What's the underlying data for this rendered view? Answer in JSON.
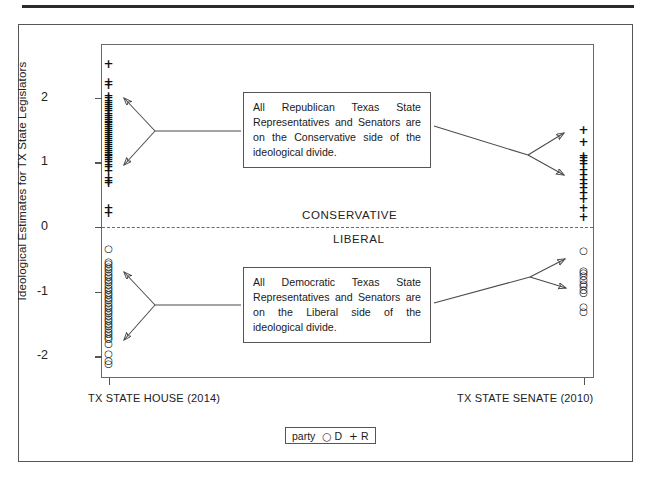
{
  "figure": {
    "y_axis_title": "Ideological Estimates for TX State Legislators",
    "divide": {
      "upper_label": "CONSERVATIVE",
      "lower_label": "LIBERAL"
    },
    "callouts": {
      "republican": "All Republican Texas State Representatives and Senators are on the Conservative side of the ideological divide.",
      "democrat": "All Democratic Texas State Representatives and Senators are on the Liberal side of the ideological divide."
    },
    "legend": {
      "title": "party",
      "d_symbol": "○",
      "d_label": "D",
      "r_symbol": "+",
      "r_label": "R"
    },
    "colors": {
      "frame": "#555555",
      "text": "#1a1a1a",
      "marker": "#111111",
      "zero_line": "#6b6b6b"
    }
  },
  "chart_data": {
    "type": "scatter",
    "title": "",
    "xlabel": "",
    "ylabel": "Ideological Estimates for TX State Legislators",
    "ylim": [
      -2.35,
      2.6
    ],
    "yticks": [
      2,
      1,
      0,
      -1,
      -2
    ],
    "ytick_labels": [
      "2",
      "1",
      "0",
      "-1",
      "-2"
    ],
    "grid": false,
    "legend_position": "bottom",
    "categories": [
      "TX STATE HOUSE (2014)",
      "TX STATE SENATE (2010)"
    ],
    "reference_line": {
      "y": 0,
      "style": "dashed",
      "above_label": "CONSERVATIVE",
      "below_label": "LIBERAL"
    },
    "series": [
      {
        "name": "R",
        "label": "Republican",
        "marker": "+",
        "points": [
          {
            "x": "TX STATE HOUSE (2014)",
            "y": 2.52
          },
          {
            "x": "TX STATE HOUSE (2014)",
            "y": 2.24
          },
          {
            "x": "TX STATE HOUSE (2014)",
            "y": 2.19
          },
          {
            "x": "TX STATE HOUSE (2014)",
            "y": 2.03
          },
          {
            "x": "TX STATE HOUSE (2014)",
            "y": 1.99
          },
          {
            "x": "TX STATE HOUSE (2014)",
            "y": 1.95
          },
          {
            "x": "TX STATE HOUSE (2014)",
            "y": 1.92
          },
          {
            "x": "TX STATE HOUSE (2014)",
            "y": 1.88
          },
          {
            "x": "TX STATE HOUSE (2014)",
            "y": 1.85
          },
          {
            "x": "TX STATE HOUSE (2014)",
            "y": 1.82
          },
          {
            "x": "TX STATE HOUSE (2014)",
            "y": 1.79
          },
          {
            "x": "TX STATE HOUSE (2014)",
            "y": 1.75
          },
          {
            "x": "TX STATE HOUSE (2014)",
            "y": 1.72
          },
          {
            "x": "TX STATE HOUSE (2014)",
            "y": 1.69
          },
          {
            "x": "TX STATE HOUSE (2014)",
            "y": 1.66
          },
          {
            "x": "TX STATE HOUSE (2014)",
            "y": 1.63
          },
          {
            "x": "TX STATE HOUSE (2014)",
            "y": 1.6
          },
          {
            "x": "TX STATE HOUSE (2014)",
            "y": 1.57
          },
          {
            "x": "TX STATE HOUSE (2014)",
            "y": 1.54
          },
          {
            "x": "TX STATE HOUSE (2014)",
            "y": 1.51
          },
          {
            "x": "TX STATE HOUSE (2014)",
            "y": 1.48
          },
          {
            "x": "TX STATE HOUSE (2014)",
            "y": 1.45
          },
          {
            "x": "TX STATE HOUSE (2014)",
            "y": 1.42
          },
          {
            "x": "TX STATE HOUSE (2014)",
            "y": 1.39
          },
          {
            "x": "TX STATE HOUSE (2014)",
            "y": 1.36
          },
          {
            "x": "TX STATE HOUSE (2014)",
            "y": 1.33
          },
          {
            "x": "TX STATE HOUSE (2014)",
            "y": 1.3
          },
          {
            "x": "TX STATE HOUSE (2014)",
            "y": 1.27
          },
          {
            "x": "TX STATE HOUSE (2014)",
            "y": 1.24
          },
          {
            "x": "TX STATE HOUSE (2014)",
            "y": 1.21
          },
          {
            "x": "TX STATE HOUSE (2014)",
            "y": 1.18
          },
          {
            "x": "TX STATE HOUSE (2014)",
            "y": 1.15
          },
          {
            "x": "TX STATE HOUSE (2014)",
            "y": 1.12
          },
          {
            "x": "TX STATE HOUSE (2014)",
            "y": 1.09
          },
          {
            "x": "TX STATE HOUSE (2014)",
            "y": 1.06
          },
          {
            "x": "TX STATE HOUSE (2014)",
            "y": 1.03
          },
          {
            "x": "TX STATE HOUSE (2014)",
            "y": 1.0
          },
          {
            "x": "TX STATE HOUSE (2014)",
            "y": 0.96
          },
          {
            "x": "TX STATE HOUSE (2014)",
            "y": 0.92
          },
          {
            "x": "TX STATE HOUSE (2014)",
            "y": 0.86
          },
          {
            "x": "TX STATE HOUSE (2014)",
            "y": 0.75
          },
          {
            "x": "TX STATE HOUSE (2014)",
            "y": 0.71
          },
          {
            "x": "TX STATE HOUSE (2014)",
            "y": 0.68
          },
          {
            "x": "TX STATE HOUSE (2014)",
            "y": 0.3
          },
          {
            "x": "TX STATE HOUSE (2014)",
            "y": 0.22
          },
          {
            "x": "TX STATE SENATE (2010)",
            "y": 1.5
          },
          {
            "x": "TX STATE SENATE (2010)",
            "y": 1.32
          },
          {
            "x": "TX STATE SENATE (2010)",
            "y": 1.1
          },
          {
            "x": "TX STATE SENATE (2010)",
            "y": 1.06
          },
          {
            "x": "TX STATE SENATE (2010)",
            "y": 1.02
          },
          {
            "x": "TX STATE SENATE (2010)",
            "y": 0.98
          },
          {
            "x": "TX STATE SENATE (2010)",
            "y": 0.88
          },
          {
            "x": "TX STATE SENATE (2010)",
            "y": 0.8
          },
          {
            "x": "TX STATE SENATE (2010)",
            "y": 0.72
          },
          {
            "x": "TX STATE SENATE (2010)",
            "y": 0.66
          },
          {
            "x": "TX STATE SENATE (2010)",
            "y": 0.6
          },
          {
            "x": "TX STATE SENATE (2010)",
            "y": 0.52
          },
          {
            "x": "TX STATE SENATE (2010)",
            "y": 0.44
          },
          {
            "x": "TX STATE SENATE (2010)",
            "y": 0.3
          },
          {
            "x": "TX STATE SENATE (2010)",
            "y": 0.16
          }
        ]
      },
      {
        "name": "D",
        "label": "Democrat",
        "marker": "○",
        "points": [
          {
            "x": "TX STATE HOUSE (2014)",
            "y": -0.33
          },
          {
            "x": "TX STATE HOUSE (2014)",
            "y": -0.52
          },
          {
            "x": "TX STATE HOUSE (2014)",
            "y": -0.56
          },
          {
            "x": "TX STATE HOUSE (2014)",
            "y": -0.6
          },
          {
            "x": "TX STATE HOUSE (2014)",
            "y": -0.64
          },
          {
            "x": "TX STATE HOUSE (2014)",
            "y": -0.68
          },
          {
            "x": "TX STATE HOUSE (2014)",
            "y": -0.72
          },
          {
            "x": "TX STATE HOUSE (2014)",
            "y": -0.76
          },
          {
            "x": "TX STATE HOUSE (2014)",
            "y": -0.8
          },
          {
            "x": "TX STATE HOUSE (2014)",
            "y": -0.84
          },
          {
            "x": "TX STATE HOUSE (2014)",
            "y": -0.88
          },
          {
            "x": "TX STATE HOUSE (2014)",
            "y": -0.92
          },
          {
            "x": "TX STATE HOUSE (2014)",
            "y": -0.96
          },
          {
            "x": "TX STATE HOUSE (2014)",
            "y": -1.0
          },
          {
            "x": "TX STATE HOUSE (2014)",
            "y": -1.04
          },
          {
            "x": "TX STATE HOUSE (2014)",
            "y": -1.08
          },
          {
            "x": "TX STATE HOUSE (2014)",
            "y": -1.12
          },
          {
            "x": "TX STATE HOUSE (2014)",
            "y": -1.16
          },
          {
            "x": "TX STATE HOUSE (2014)",
            "y": -1.2
          },
          {
            "x": "TX STATE HOUSE (2014)",
            "y": -1.24
          },
          {
            "x": "TX STATE HOUSE (2014)",
            "y": -1.28
          },
          {
            "x": "TX STATE HOUSE (2014)",
            "y": -1.32
          },
          {
            "x": "TX STATE HOUSE (2014)",
            "y": -1.36
          },
          {
            "x": "TX STATE HOUSE (2014)",
            "y": -1.4
          },
          {
            "x": "TX STATE HOUSE (2014)",
            "y": -1.44
          },
          {
            "x": "TX STATE HOUSE (2014)",
            "y": -1.48
          },
          {
            "x": "TX STATE HOUSE (2014)",
            "y": -1.52
          },
          {
            "x": "TX STATE HOUSE (2014)",
            "y": -1.56
          },
          {
            "x": "TX STATE HOUSE (2014)",
            "y": -1.6
          },
          {
            "x": "TX STATE HOUSE (2014)",
            "y": -1.64
          },
          {
            "x": "TX STATE HOUSE (2014)",
            "y": -1.68
          },
          {
            "x": "TX STATE HOUSE (2014)",
            "y": -1.72
          },
          {
            "x": "TX STATE HOUSE (2014)",
            "y": -1.8
          },
          {
            "x": "TX STATE HOUSE (2014)",
            "y": -1.95
          },
          {
            "x": "TX STATE HOUSE (2014)",
            "y": -2.05
          },
          {
            "x": "TX STATE HOUSE (2014)",
            "y": -2.1
          },
          {
            "x": "TX STATE SENATE (2010)",
            "y": -0.36
          },
          {
            "x": "TX STATE SENATE (2010)",
            "y": -0.66
          },
          {
            "x": "TX STATE SENATE (2010)",
            "y": -0.7
          },
          {
            "x": "TX STATE SENATE (2010)",
            "y": -0.74
          },
          {
            "x": "TX STATE SENATE (2010)",
            "y": -0.8
          },
          {
            "x": "TX STATE SENATE (2010)",
            "y": -0.86
          },
          {
            "x": "TX STATE SENATE (2010)",
            "y": -0.9
          },
          {
            "x": "TX STATE SENATE (2010)",
            "y": -0.96
          },
          {
            "x": "TX STATE SENATE (2010)",
            "y": -1.0
          },
          {
            "x": "TX STATE SENATE (2010)",
            "y": -1.22
          },
          {
            "x": "TX STATE SENATE (2010)",
            "y": -1.3
          }
        ]
      }
    ],
    "annotations": [
      {
        "text": "All Republican Texas State Representatives and Senators are on the Conservative side of the ideological divide.",
        "points_to": [
          "TX STATE HOUSE (2014) R cluster",
          "TX STATE SENATE (2010) R cluster"
        ]
      },
      {
        "text": "All Democratic Texas State Representatives and Senators are on the Liberal side of the ideological divide.",
        "points_to": [
          "TX STATE HOUSE (2014) D cluster",
          "TX STATE SENATE (2010) D cluster"
        ]
      }
    ]
  }
}
